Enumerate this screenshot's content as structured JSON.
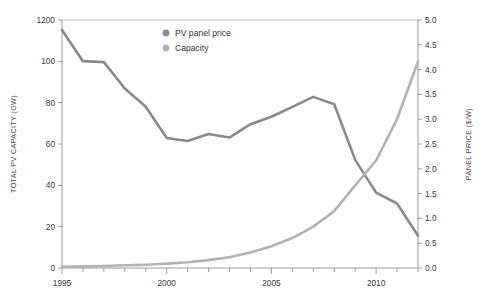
{
  "chart_data": {
    "type": "line",
    "title": "",
    "xlabel": "",
    "ylabel": "TOTAL PV CAPACITY (GW)",
    "y2label": "PANEL PRICE ($/W)",
    "grid": false,
    "legend_position": "top-right",
    "x": [
      1995,
      1996,
      1997,
      1998,
      1999,
      2000,
      2001,
      2002,
      2003,
      2004,
      2005,
      2006,
      2007,
      2008,
      2009,
      2010,
      2011,
      2012
    ],
    "xlim": [
      1995,
      2012
    ],
    "x_tick_labels": [
      "1995",
      "2000",
      "2005",
      "2010"
    ],
    "x_tick_values": [
      1995,
      2000,
      2005,
      2010
    ],
    "ylim": [
      0,
      120
    ],
    "y_tick_labels": [
      "0",
      "20",
      "40",
      "60",
      "80",
      "100",
      "1200"
    ],
    "y_tick_values": [
      0,
      20,
      40,
      60,
      80,
      100,
      120
    ],
    "y2lim": [
      0.0,
      5.0
    ],
    "y2_tick_labels": [
      "0.0",
      "0.5",
      "1.0",
      "1.5",
      "2.0",
      "2.5",
      "3.0",
      "3.5",
      "4.0",
      "4.5",
      "5.0"
    ],
    "y2_tick_values": [
      0.0,
      0.5,
      1.0,
      1.5,
      2.0,
      2.5,
      3.0,
      3.5,
      4.0,
      4.5,
      5.0
    ],
    "series": [
      {
        "name": "PV panel price",
        "axis": "right",
        "unit": "$/W",
        "color": "#8a8a8a",
        "values": [
          4.8,
          4.17,
          4.15,
          3.62,
          3.25,
          2.62,
          2.56,
          2.7,
          2.63,
          2.9,
          3.05,
          3.25,
          3.45,
          3.3,
          2.18,
          1.52,
          1.3,
          0.65
        ]
      },
      {
        "name": "Capacity",
        "axis": "left",
        "unit": "GW",
        "color": "#b3b3b3",
        "values": [
          0.6,
          0.8,
          1.0,
          1.3,
          1.6,
          2.1,
          2.8,
          3.8,
          5.2,
          7.5,
          10.5,
          14.5,
          20.0,
          27.5,
          40.0,
          52.0,
          72.0,
          100.0
        ]
      }
    ]
  },
  "legend": {
    "items": [
      {
        "label": "PV panel price",
        "color": "#8a8a8a"
      },
      {
        "label": "Capacity",
        "color": "#b3b3b3"
      }
    ]
  },
  "axes": {
    "left_title": "TOTAL PV CAPACITY (GW)",
    "right_title": "PANEL PRICE ($/W)"
  }
}
